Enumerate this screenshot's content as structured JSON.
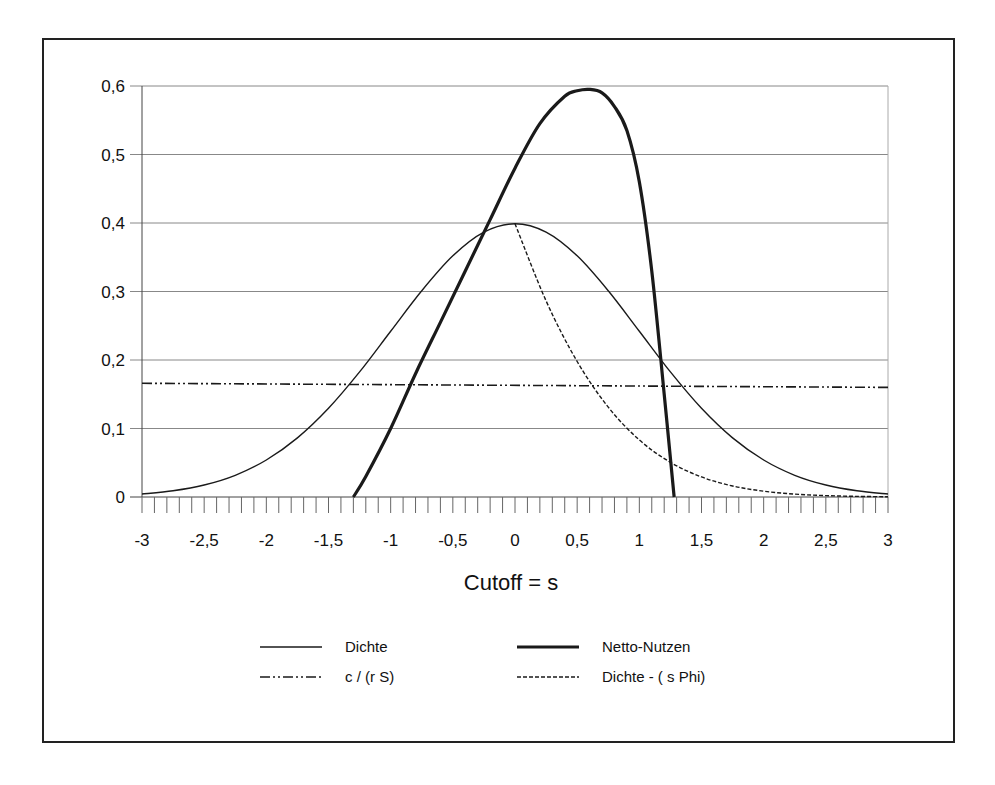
{
  "chart_data": {
    "type": "line",
    "title": "",
    "xlabel": "Cutoff = s",
    "ylabel": "",
    "xlim": [
      -3,
      3
    ],
    "ylim": [
      0,
      0.6
    ],
    "grid": {
      "horizontal": true,
      "vertical": false
    },
    "legend_position": "bottom",
    "x_tick_labels": [
      "-3",
      "-2,5",
      "-2",
      "-1,5",
      "-1",
      "-0,5",
      "0",
      "0,5",
      "1",
      "1,5",
      "2",
      "2,5",
      "3"
    ],
    "x_tick_values": [
      -3,
      -2.5,
      -2,
      -1.5,
      -1,
      -0.5,
      0,
      0.5,
      1,
      1.5,
      2,
      2.5,
      3
    ],
    "x_minor_tick_step": 0.1,
    "y_tick_labels": [
      "0",
      "0,1",
      "0,2",
      "0,3",
      "0,4",
      "0,5",
      "0,6"
    ],
    "y_tick_values": [
      0,
      0.1,
      0.2,
      0.3,
      0.4,
      0.5,
      0.6
    ],
    "series": [
      {
        "name": "Dichte",
        "style": "solid-thin",
        "x": [
          -3,
          -2.75,
          -2.5,
          -2.25,
          -2,
          -1.75,
          -1.5,
          -1.25,
          -1,
          -0.75,
          -0.5,
          -0.25,
          0,
          0.25,
          0.5,
          0.75,
          1,
          1.25,
          1.5,
          1.75,
          2,
          2.25,
          2.5,
          2.75,
          3
        ],
        "y": [
          0.0044,
          0.0091,
          0.0175,
          0.0317,
          0.054,
          0.0863,
          0.1295,
          0.1826,
          0.242,
          0.3011,
          0.3521,
          0.3867,
          0.3989,
          0.3867,
          0.3521,
          0.3011,
          0.242,
          0.1826,
          0.1295,
          0.0863,
          0.054,
          0.0317,
          0.0175,
          0.0091,
          0.0044
        ]
      },
      {
        "name": "Netto-Nutzen",
        "style": "solid-thick",
        "x": [
          -1.3,
          -1.2,
          -1.0,
          -0.8,
          -0.6,
          -0.4,
          -0.2,
          0,
          0.2,
          0.4,
          0.5,
          0.6,
          0.7,
          0.8,
          0.9,
          1.0,
          1.1,
          1.2,
          1.28
        ],
        "y": [
          0,
          0.03,
          0.1,
          0.18,
          0.255,
          0.33,
          0.405,
          0.48,
          0.545,
          0.585,
          0.593,
          0.595,
          0.59,
          0.57,
          0.535,
          0.46,
          0.33,
          0.15,
          0
        ]
      },
      {
        "name": "c / (r S)",
        "style": "dash-dot-dot",
        "x": [
          -3,
          3
        ],
        "y": [
          0.166,
          0.16
        ]
      },
      {
        "name": "Dichte - ( s  Phi)",
        "style": "dashed",
        "x": [
          0,
          0.25,
          0.5,
          0.75,
          1,
          1.25,
          1.5,
          1.75,
          2,
          2.25,
          2.5,
          2.75,
          3
        ],
        "y": [
          0.3989,
          0.2863,
          0.1978,
          0.1312,
          0.0833,
          0.0506,
          0.0293,
          0.0161,
          0.0085,
          0.0042,
          0.002,
          0.0009,
          0.0004
        ]
      }
    ]
  },
  "legend": [
    {
      "label": "Dichte",
      "style": "solid-thin"
    },
    {
      "label": "Netto-Nutzen",
      "style": "solid-thick"
    },
    {
      "label": "c / (r S)",
      "style": "dash-dot-dot"
    },
    {
      "label": "Dichte - ( s  Phi)",
      "style": "dashed"
    }
  ],
  "colors": {
    "line": "#1a1a1a",
    "grid": "#888888",
    "frame": "#222222"
  }
}
